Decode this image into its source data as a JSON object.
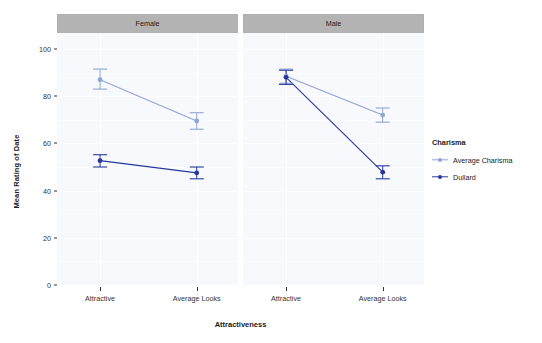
{
  "chart_data": {
    "type": "line",
    "title": "",
    "xlabel": "Attractiveness",
    "ylabel": "Mean Rating of Date",
    "ylim": [
      0,
      105
    ],
    "yticks": [
      0,
      20,
      40,
      60,
      80,
      100
    ],
    "ytick_labels": [
      "0",
      "20",
      "40",
      "60",
      "80",
      "100"
    ],
    "categories": [
      "Attractive",
      "Average Looks"
    ],
    "grid": true,
    "legend_position": "right",
    "legend_title": "Charisma",
    "facet_variable": "Gender",
    "facets": [
      {
        "label": "Female",
        "series": [
          {
            "name": "Average Charisma",
            "color": "#8fa5d6",
            "values": [
              87.0,
              69.5
            ],
            "errors_low": [
              83.0,
              66.0
            ],
            "errors_high": [
              91.5,
              73.0
            ]
          },
          {
            "name": "Dullard",
            "color": "#26389c",
            "values": [
              52.7,
              47.5
            ],
            "errors_low": [
              50.0,
              45.0
            ],
            "errors_high": [
              55.2,
              50.0
            ]
          }
        ]
      },
      {
        "label": "Male",
        "series": [
          {
            "name": "Average Charisma",
            "color": "#8fa5d6",
            "values": [
              88.5,
              72.0
            ],
            "errors_low": [
              85.5,
              69.0
            ],
            "errors_high": [
              91.5,
              75.0
            ]
          },
          {
            "name": "Dullard",
            "color": "#26389c",
            "values": [
              88.0,
              47.8
            ],
            "errors_low": [
              85.0,
              45.0
            ],
            "errors_high": [
              91.0,
              50.5
            ]
          }
        ]
      }
    ],
    "legend_entries": [
      {
        "label": "Average Charisma",
        "color": "#8fa5d6"
      },
      {
        "label": "Dullard",
        "color": "#26389c"
      }
    ]
  },
  "colors": {
    "panel_background": "#f7f9fc",
    "strip_background": "#b3b3b3",
    "gridline": "#ffffff",
    "axis_text": "#333333",
    "average_charisma": "#8fa5d6",
    "dullard": "#26389c"
  }
}
